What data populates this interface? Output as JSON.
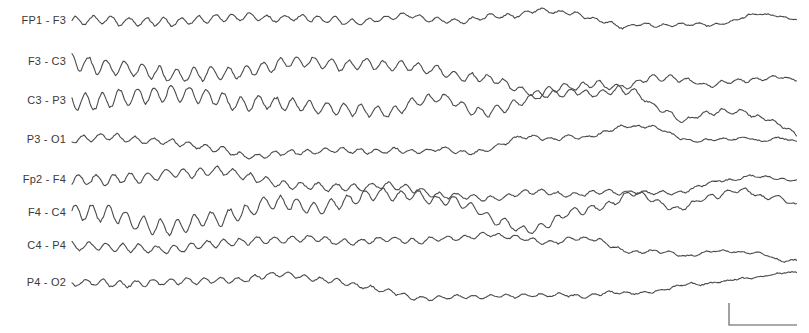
{
  "figure": {
    "type": "eeg-montage",
    "trace_color": "#4a4a4a",
    "background": "#ffffff"
  },
  "channels": [
    {
      "label": "FP1 - F3",
      "y": 21,
      "amp_left": 5,
      "amp_right": 4,
      "seed": 1
    },
    {
      "label": "F3 - C3",
      "y": 62,
      "amp_left": 9,
      "amp_right": 6,
      "seed": 2
    },
    {
      "label": "C3 - P3",
      "y": 101,
      "amp_left": 10,
      "amp_right": 7,
      "seed": 3
    },
    {
      "label": "P3 - O1",
      "y": 140,
      "amp_left": 4,
      "amp_right": 5,
      "seed": 4
    },
    {
      "label": "Fp2 - F4",
      "y": 180,
      "amp_left": 6,
      "amp_right": 4,
      "seed": 5
    },
    {
      "label": "F4 - C4",
      "y": 213,
      "amp_left": 10,
      "amp_right": 7,
      "seed": 6
    },
    {
      "label": "C4 - P4",
      "y": 246,
      "amp_left": 5,
      "amp_right": 4,
      "seed": 7
    },
    {
      "label": "P4 - O2",
      "y": 283,
      "amp_left": 4,
      "amp_right": 3,
      "seed": 8
    }
  ],
  "calibration_bar": {
    "x": 729,
    "y_top": 303,
    "y_bottom": 325,
    "x_end": 797
  }
}
